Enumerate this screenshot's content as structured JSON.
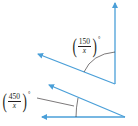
{
  "diagram": {
    "angles": [
      {
        "id": "top-angle",
        "label": {
          "numerator": "150",
          "denominator": "x",
          "unit": "°"
        }
      },
      {
        "id": "bottom-angle",
        "label": {
          "numerator": "450",
          "denominator": "x",
          "unit": "°"
        }
      }
    ],
    "colors": {
      "ray": "#4a9fd8",
      "arc": "#231f20",
      "text": "#231f20"
    }
  }
}
